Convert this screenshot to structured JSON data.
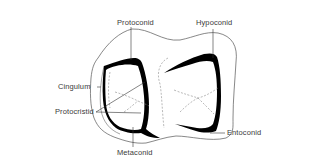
{
  "figure": {
    "labels": {
      "protoconid": "Protoconid",
      "hypoconid": "Hypoconid",
      "cingulum": "Cingulum",
      "protocristid": "Protocristid",
      "metaconid": "Metaconid",
      "entoconid": "Entoconid"
    },
    "colors": {
      "background": "#ffffff",
      "outline": "#555555",
      "crest_fill": "#000000",
      "dashed": "#8a8a8a",
      "text": "#3a3a3a"
    }
  }
}
